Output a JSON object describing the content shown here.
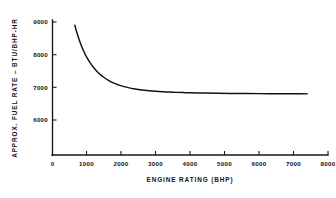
{
  "chart_data": {
    "type": "line",
    "title": "",
    "subtitle": "",
    "xlabel": "ENGINE RATING (BHP)",
    "ylabel": "APPROX. FUEL RATE – BTU/BHP-HR",
    "xlim": [
      0,
      8000
    ],
    "ylim": [
      5400,
      9150
    ],
    "xticks": [
      0,
      1000,
      2000,
      3000,
      4000,
      5000,
      6000,
      7000,
      8000
    ],
    "xticklabels": [
      "0",
      "1000",
      "2000",
      "3000",
      "4000",
      "5000",
      "6000",
      "7000",
      "8000"
    ],
    "yticks": [
      6000,
      7000,
      8000,
      9000
    ],
    "yticklabels": [
      "6000",
      "7000",
      "8000",
      "9000"
    ],
    "grid": false,
    "legend": null,
    "legend_position": "none",
    "series": [
      {
        "name": "Approximate fuel rate",
        "color": "#111111",
        "x": [
          650,
          700,
          800,
          900,
          1000,
          1100,
          1200,
          1300,
          1400,
          1500,
          1600,
          1700,
          1800,
          1900,
          2000,
          2200,
          2400,
          2600,
          2800,
          3000,
          3200,
          3400,
          3600,
          3800,
          4000,
          4400,
          4800,
          5200,
          5600,
          6000,
          6400,
          6800,
          7200,
          7400
        ],
        "y": [
          8900,
          8700,
          8380,
          8120,
          7910,
          7740,
          7600,
          7480,
          7380,
          7300,
          7230,
          7170,
          7120,
          7080,
          7045,
          6990,
          6950,
          6920,
          6898,
          6880,
          6866,
          6855,
          6846,
          6839,
          6833,
          6824,
          6818,
          6813,
          6810,
          6807,
          6805,
          6803,
          6801,
          6800
        ]
      }
    ],
    "annotations": []
  },
  "axis": {
    "x_title": "ENGINE RATING (BHP)",
    "y_title": "APPROX. FUEL RATE – BTU/BHP-HR",
    "x_tick_labels": [
      "0",
      "1000",
      "2000",
      "3000",
      "4000",
      "5000",
      "6000",
      "7000",
      "8000"
    ],
    "y_tick_labels": [
      "6000",
      "7000",
      "8000",
      "9000"
    ]
  },
  "figure": {
    "background_color": "#ffffff",
    "line_color": "#111111",
    "axis_color": "#161616"
  }
}
